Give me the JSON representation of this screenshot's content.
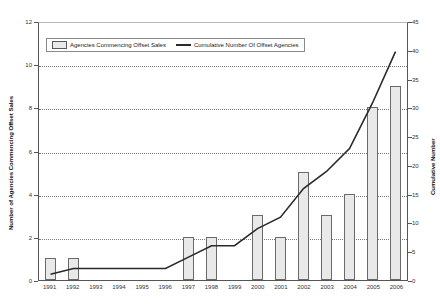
{
  "chart_data": {
    "type": "bar",
    "title": "",
    "xlabel": "",
    "ylabel": "Number of Agencies Commencing Offset Sales",
    "y2label": "Cumulative Number",
    "ylim": [
      0,
      12
    ],
    "y2lim": [
      0,
      45
    ],
    "yticks": [
      0,
      2,
      4,
      6,
      8,
      10,
      12
    ],
    "y2ticks": [
      0,
      5,
      10,
      15,
      20,
      25,
      30,
      35,
      40,
      45
    ],
    "grid": true,
    "legend_position": "top-left-inside",
    "categories": [
      "1991",
      "1992",
      "1993",
      "1994",
      "1995",
      "1996",
      "1997",
      "1998",
      "1999",
      "2000",
      "2001",
      "2002",
      "2003",
      "2004",
      "2005",
      "2006"
    ],
    "series": [
      {
        "name": "Agencies Commencing Offset Sales",
        "type": "bar",
        "axis": "left",
        "color": "#e9e9e9",
        "values": [
          1,
          1,
          0,
          0,
          0,
          0,
          2,
          2,
          0,
          3,
          2,
          5,
          3,
          4,
          8,
          9
        ]
      },
      {
        "name": "Cumulative Number Of Offset Agencies",
        "type": "line",
        "axis": "right",
        "color": "#2a2a2a",
        "values": [
          1,
          2,
          2,
          2,
          2,
          2,
          4,
          6,
          6,
          9,
          11,
          16,
          19,
          23,
          31,
          40
        ]
      }
    ]
  },
  "legend": {
    "bar_label": "Agencies Commencing Offset Sales",
    "line_label": "Cumulative Number Of Offset Agencies"
  }
}
